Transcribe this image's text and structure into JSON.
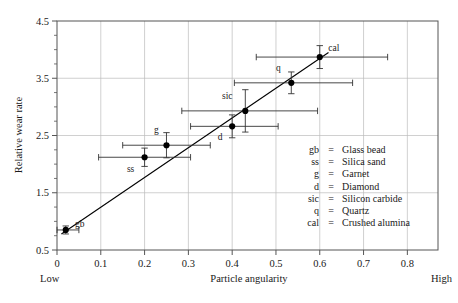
{
  "chart_data": {
    "type": "scatter",
    "title": "",
    "xlabel": "Particle angularity",
    "ylabel": "Relative wear rate",
    "xlim": [
      0.0,
      0.87
    ],
    "ylim": [
      0.5,
      4.5
    ],
    "xticks": [
      "0",
      "0.1",
      "0.2",
      "0.3",
      "0.4",
      "0.5",
      "0.6",
      "0.7",
      "0.8"
    ],
    "xtick_values": [
      0.0,
      0.1,
      0.2,
      0.3,
      0.4,
      0.5,
      0.6,
      0.7,
      0.8
    ],
    "yticks": [
      "0.5",
      "1.5",
      "2.5",
      "3.5",
      "4.5"
    ],
    "ytick_values": [
      0.5,
      1.5,
      2.5,
      3.5,
      4.5
    ],
    "y_minor_interval": 0.25,
    "grid": true,
    "grid_color": "#bbbbbb",
    "axis_color": "#555555",
    "marker_color": "#000000",
    "legend_position": "inside-lower-right",
    "x_axis_low_label": "Low",
    "x_axis_high_label": "High",
    "trendline": {
      "label": "fit line",
      "x_start": 0.01,
      "y_start": 0.78,
      "x_end": 0.62,
      "y_end": 3.95
    },
    "points": [
      {
        "code": "gb",
        "name": "Glass bead",
        "x": 0.02,
        "y": 0.85,
        "x_err_low": 0.02,
        "x_err_high": 0.03,
        "y_err_low": 0.07,
        "y_err_high": 0.07,
        "label_dx": 14,
        "label_dy": -3
      },
      {
        "code": "ss",
        "name": "Silica sand",
        "x": 0.2,
        "y": 2.12,
        "x_err_low": 0.105,
        "x_err_high": 0.105,
        "y_err_low": 0.16,
        "y_err_high": 0.16,
        "label_dx": -14,
        "label_dy": 15
      },
      {
        "code": "g",
        "name": "Garnet",
        "x": 0.25,
        "y": 2.33,
        "x_err_low": 0.1,
        "x_err_high": 0.1,
        "y_err_low": 0.22,
        "y_err_high": 0.22,
        "label_dx": -10,
        "label_dy": -12
      },
      {
        "code": "d",
        "name": "Diamond",
        "x": 0.4,
        "y": 2.66,
        "x_err_low": 0.095,
        "x_err_high": 0.105,
        "y_err_low": 0.2,
        "y_err_high": 0.2,
        "label_dx": -12,
        "label_dy": 14
      },
      {
        "code": "sic",
        "name": "Silicon carbide",
        "x": 0.43,
        "y": 2.93,
        "x_err_low": 0.145,
        "x_err_high": 0.165,
        "y_err_low": 0.37,
        "y_err_high": 0.37,
        "label_dx": -18,
        "label_dy": -12
      },
      {
        "code": "q",
        "name": "Quartz",
        "x": 0.535,
        "y": 3.42,
        "x_err_low": 0.13,
        "x_err_high": 0.14,
        "y_err_low": 0.19,
        "y_err_high": 0.19,
        "label_dx": -13,
        "label_dy": -12
      },
      {
        "code": "cal",
        "name": "Crushed alumina",
        "x": 0.6,
        "y": 3.87,
        "x_err_low": 0.145,
        "x_err_high": 0.155,
        "y_err_low": 0.2,
        "y_err_high": 0.2,
        "label_dx": 14,
        "label_dy": -6
      }
    ],
    "legend_entries": [
      {
        "code": "gb",
        "eq": "=",
        "name": "Glass bead"
      },
      {
        "code": "ss",
        "eq": "=",
        "name": "Silica sand"
      },
      {
        "code": "g",
        "eq": "=",
        "name": "Garnet"
      },
      {
        "code": "d",
        "eq": "=",
        "name": "Diamond"
      },
      {
        "code": "sic",
        "eq": "=",
        "name": "Silicon carbide"
      },
      {
        "code": "q",
        "eq": "=",
        "name": "Quartz"
      },
      {
        "code": "cal",
        "eq": "=",
        "name": "Crushed alumina"
      }
    ]
  }
}
